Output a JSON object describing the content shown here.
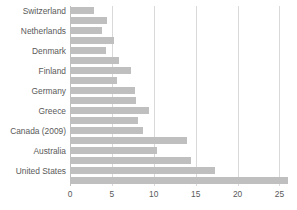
{
  "chart_data": {
    "type": "bar",
    "orientation": "horizontal",
    "title": "",
    "subtitle": "",
    "xlabel": "",
    "ylabel": "",
    "xlim": [
      0,
      26.5
    ],
    "xticks": [
      0,
      5,
      10,
      15,
      20,
      25
    ],
    "xtick_labels": [
      "0",
      "5",
      "10",
      "15",
      "20",
      "25"
    ],
    "grid": true,
    "legend": false,
    "legend_position": "none",
    "categories": [
      "Switzerland",
      "Netherlands",
      "Denmark",
      "Finland",
      "Germany",
      "Greece",
      "Canada (2009)",
      "Australia",
      "United States"
    ],
    "series": [
      {
        "name": "Series 1",
        "values": [
          2.9,
          3.8,
          4.3,
          7.3,
          7.7,
          9.4,
          8.7,
          10.4,
          17.3
        ]
      },
      {
        "name": "Series 2",
        "values": [
          4.4,
          5.3,
          5.9,
          5.6,
          7.9,
          8.1,
          14.0,
          14.4,
          26.0
        ]
      }
    ],
    "bars": [
      {
        "category": "Switzerland",
        "series": "Series 1",
        "value": 2.9
      },
      {
        "category": "Switzerland",
        "series": "Series 2",
        "value": 4.4
      },
      {
        "category": "Netherlands",
        "series": "Series 1",
        "value": 3.8
      },
      {
        "category": "Netherlands",
        "series": "Series 2",
        "value": 5.3
      },
      {
        "category": "Denmark",
        "series": "Series 1",
        "value": 4.3
      },
      {
        "category": "Denmark",
        "series": "Series 2",
        "value": 5.9
      },
      {
        "category": "Finland",
        "series": "Series 1",
        "value": 7.3
      },
      {
        "category": "Finland",
        "series": "Series 2",
        "value": 5.6
      },
      {
        "category": "Germany",
        "series": "Series 1",
        "value": 7.7
      },
      {
        "category": "Germany",
        "series": "Series 2",
        "value": 7.9
      },
      {
        "category": "Greece",
        "series": "Series 1",
        "value": 9.4
      },
      {
        "category": "Greece",
        "series": "Series 2",
        "value": 8.1
      },
      {
        "category": "Canada (2009)",
        "series": "Series 1",
        "value": 8.7
      },
      {
        "category": "Canada (2009)",
        "series": "Series 2",
        "value": 14.0
      },
      {
        "category": "Australia",
        "series": "Series 1",
        "value": 10.4
      },
      {
        "category": "Australia",
        "series": "Series 2",
        "value": 14.4
      },
      {
        "category": "United States",
        "series": "Series 1",
        "value": 17.3
      },
      {
        "category": "United States",
        "series": "Series 2",
        "value": 26.0
      }
    ],
    "colors": {
      "bar": "#bfbfbf",
      "gridline": "#d9d9d9",
      "axis": "#bfbfbf",
      "text": "#595959",
      "background": "#ffffff"
    }
  }
}
